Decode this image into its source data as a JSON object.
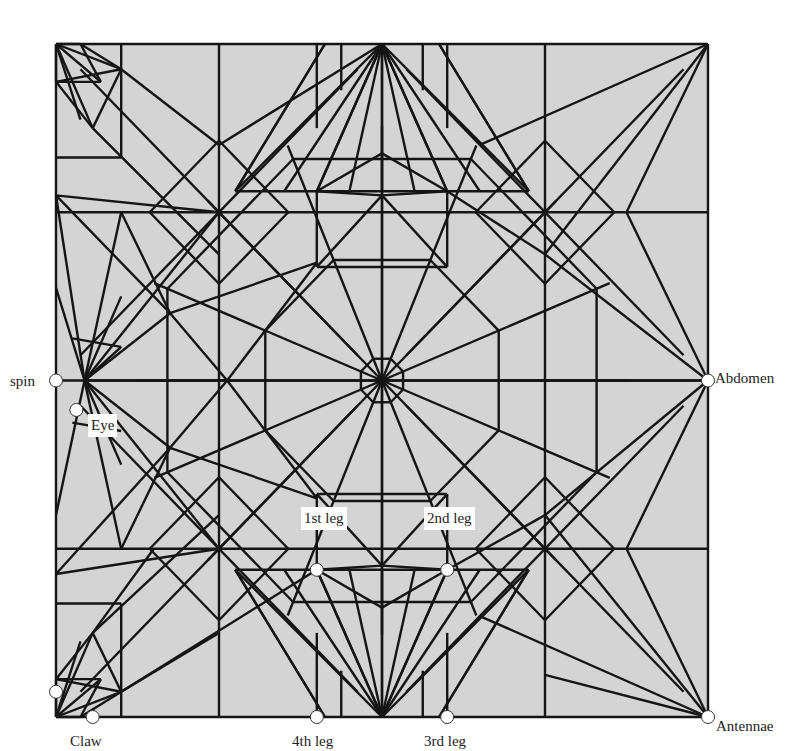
{
  "figure": {
    "type": "origami crease pattern",
    "square": {
      "left": 56,
      "top": 44,
      "right": 708,
      "bottom": 717
    },
    "colors": {
      "paper": "#d4d4d4",
      "crease": "#151515",
      "flap_marker": "#ffffff",
      "background": "#ffffff"
    }
  },
  "labels": {
    "spin": "spin",
    "eye": "Eye",
    "abdomen": "Abdomen",
    "leg1": "1st leg",
    "leg2": "2nd leg",
    "leg3": "3rd leg",
    "leg4": "4th leg",
    "claw": "Claw",
    "antennae": "Antennae"
  },
  "flap_points": [
    {
      "name": "spin",
      "x": 0,
      "y": 4
    },
    {
      "name": "eye",
      "x": 0.25,
      "y": 4.35
    },
    {
      "name": "abdomen",
      "x": 8,
      "y": 4
    },
    {
      "name": "1st-leg",
      "x": 3.2,
      "y": 6.25
    },
    {
      "name": "2nd-leg",
      "x": 4.8,
      "y": 6.25
    },
    {
      "name": "3rd-leg",
      "x": 4.8,
      "y": 8
    },
    {
      "name": "4th-leg",
      "x": 3.2,
      "y": 8
    },
    {
      "name": "claw-a",
      "x": 0,
      "y": 7.7
    },
    {
      "name": "claw-b",
      "x": 0.45,
      "y": 8
    },
    {
      "name": "antennae",
      "x": 8,
      "y": 8
    }
  ]
}
